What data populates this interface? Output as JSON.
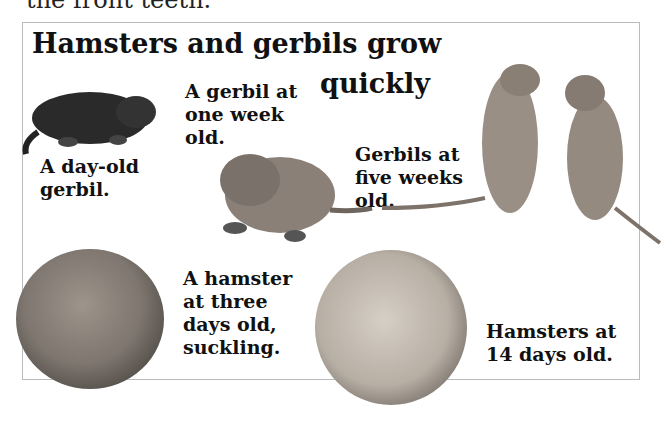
{
  "page": {
    "top_text": "the front teeth.",
    "title_line1": "Hamsters and gerbils grow",
    "title_line2": "quickly"
  },
  "captions": {
    "day_old_gerbil": [
      "A day-old",
      "gerbil."
    ],
    "week_old_gerbil": [
      "A gerbil at",
      "one week",
      "old."
    ],
    "five_week_gerbils": [
      "Gerbils at",
      "five weeks",
      "old."
    ],
    "three_day_hamster": [
      "A hamster",
      "at three",
      "days old,",
      "suckling."
    ],
    "fourteen_day_hamsters": [
      "Hamsters at",
      "14 days old."
    ]
  },
  "images": {
    "day_old_gerbil": "newborn-gerbil-photo",
    "week_old_gerbil": "week-old-gerbil-photo",
    "five_week_gerbils": "two-gerbils-standing-photo",
    "three_day_hamster": "nursing-hamster-circle-photo",
    "fourteen_day_hamsters": "young-hamsters-circle-photo"
  }
}
